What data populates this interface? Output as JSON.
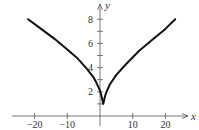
{
  "chart_data": {
    "type": "line",
    "title": "",
    "xlabel": "x",
    "ylabel": "y",
    "xlim": [
      -24,
      26
    ],
    "ylim": [
      0,
      9
    ],
    "x_ticks": [
      -20,
      -10,
      10,
      20
    ],
    "x_tick_labels": [
      "−20",
      "−10",
      "10",
      "20"
    ],
    "y_ticks": [
      1,
      2,
      3,
      4,
      5,
      6,
      7,
      8
    ],
    "y_tick_labels": {
      "2": "2",
      "4": "4",
      "6": "6",
      "8": "8"
    },
    "grid": false,
    "series": [
      {
        "name": "curve",
        "color": "#111111",
        "x": [
          -22,
          -18,
          -14,
          -10,
          -7,
          -4,
          -2,
          -1,
          0,
          0.5,
          1,
          1.5,
          2,
          3,
          5,
          8,
          12,
          16,
          20,
          23
        ],
        "y": [
          8.0,
          7.2,
          6.4,
          5.5,
          4.8,
          3.9,
          3.2,
          2.7,
          2.1,
          1.6,
          1.0,
          1.6,
          2.0,
          2.6,
          3.4,
          4.3,
          5.4,
          6.3,
          7.2,
          8.0
        ]
      }
    ]
  }
}
